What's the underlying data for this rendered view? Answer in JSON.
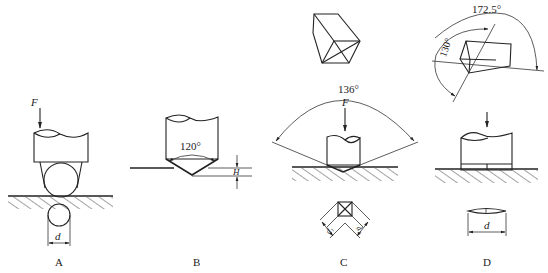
{
  "panels": [
    {
      "id": "A",
      "label": "A",
      "force": "F",
      "dimension": "d",
      "indenter": "ball"
    },
    {
      "id": "B",
      "label": "B",
      "angle": "120°",
      "dimension": "H",
      "indenter": "cone"
    },
    {
      "id": "C",
      "label": "C",
      "force": "F",
      "angle": "136°",
      "dimensions": [
        "d1",
        "d2"
      ],
      "indenter": "square-pyramid"
    },
    {
      "id": "D",
      "label": "D",
      "angles": [
        "172.5°",
        "130°"
      ],
      "dimension": "d",
      "indenter": "rhombic-pyramid"
    }
  ],
  "labels": {
    "A": "A",
    "B": "B",
    "C": "C",
    "D": "D",
    "F": "F",
    "d": "d",
    "H": "H",
    "angleB": "120°",
    "angleC": "136°",
    "angleD1": "172.5°",
    "angleD2": "130°",
    "d1": "d₁",
    "d2": "d₂"
  }
}
